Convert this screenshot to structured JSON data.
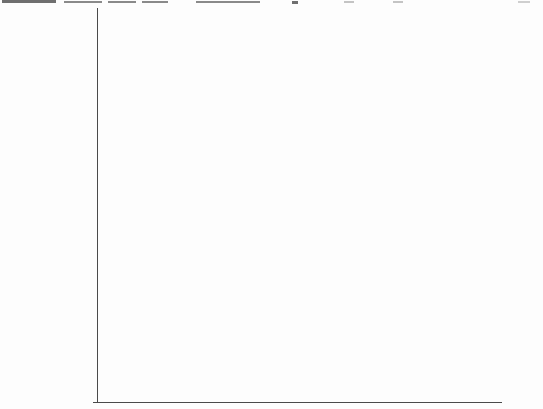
{
  "chart_data": {
    "type": "bar",
    "orientation": "horizontal",
    "title": "",
    "xlabel": "",
    "ylabel": "",
    "grid": false,
    "legend": false,
    "xlim": [
      0,
      50
    ],
    "categories": [
      "China",
      "Mexico",
      "Brazil",
      "Poland",
      "Taiwan",
      "Czech Republic",
      "Singapore",
      "Korea",
      "Japan",
      "Spain",
      "U.S",
      "Italy",
      "France",
      "Canada",
      "Ireland.",
      "U.K.",
      "Australia",
      "Netherlands",
      "Sweden",
      "Germany",
      "Norway"
    ],
    "values": [
      0.81,
      2.92,
      5.96,
      6.17,
      6.58,
      8.2,
      8.35,
      16.02,
      19.75,
      20.98,
      24.59,
      28.23,
      28.57,
      28.91,
      29.04,
      29.73,
      30.17,
      34.07,
      36.03,
      37.66,
      48.56
    ],
    "value_labels": [
      "$0.81",
      "$2.92",
      "$5.96",
      "$6.17",
      "$6.58",
      "$8.20",
      "$8.35",
      "$16.02",
      "$19.75",
      "$20.98",
      "$24.59",
      "$28.23",
      "$28.57",
      "$28.91",
      "$29.04",
      "$29.73",
      "$30.17",
      "$34.07",
      "$36.03",
      "$37.66",
      "$48.56"
    ],
    "colors": {
      "bar_fill": "#d8d8d8",
      "bar_border": "#4f4f4f",
      "axis": "#4a4a4a",
      "text": "#1b1b1b",
      "background": "#fdfdfd"
    }
  }
}
